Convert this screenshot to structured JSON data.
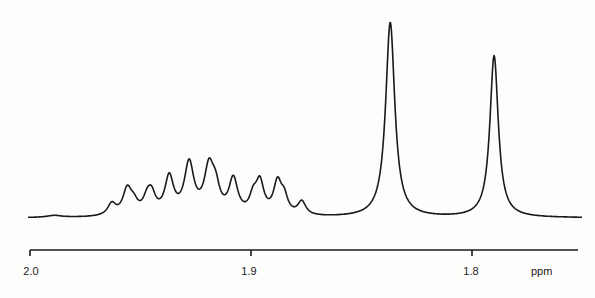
{
  "chart_data": {
    "type": "line",
    "title": "",
    "xlabel": "ppm",
    "ylabel": "",
    "x_axis_reversed": true,
    "xlim": [
      2.0,
      1.749
    ],
    "grid": false,
    "legend": null,
    "ticks": [
      {
        "value": 2.0,
        "label": "2.0"
      },
      {
        "value": 1.9,
        "label": "1.9"
      },
      {
        "value": 1.8,
        "label": "1.8"
      }
    ],
    "unit_label": "ppm",
    "baseline": 0,
    "peaks": [
      {
        "ppm": 1.989,
        "height": 0.01,
        "width": 0.004
      },
      {
        "ppm": 1.963,
        "height": 0.06,
        "width": 0.0022
      },
      {
        "ppm": 1.956,
        "height": 0.13,
        "width": 0.0024
      },
      {
        "ppm": 1.953,
        "height": 0.05,
        "width": 0.0022
      },
      {
        "ppm": 1.947,
        "height": 0.07,
        "width": 0.0022
      },
      {
        "ppm": 1.945,
        "height": 0.09,
        "width": 0.0022
      },
      {
        "ppm": 1.937,
        "height": 0.19,
        "width": 0.0024
      },
      {
        "ppm": 1.928,
        "height": 0.26,
        "width": 0.0026
      },
      {
        "ppm": 1.919,
        "height": 0.23,
        "width": 0.0026
      },
      {
        "ppm": 1.916,
        "height": 0.11,
        "width": 0.0022
      },
      {
        "ppm": 1.908,
        "height": 0.18,
        "width": 0.0024
      },
      {
        "ppm": 1.899,
        "height": 0.08,
        "width": 0.002
      },
      {
        "ppm": 1.896,
        "height": 0.16,
        "width": 0.0022
      },
      {
        "ppm": 1.888,
        "height": 0.16,
        "width": 0.0022
      },
      {
        "ppm": 1.885,
        "height": 0.08,
        "width": 0.002
      },
      {
        "ppm": 1.877,
        "height": 0.07,
        "width": 0.0022
      },
      {
        "ppm": 1.837,
        "height": 1.0,
        "width": 0.0025
      },
      {
        "ppm": 1.79,
        "height": 0.83,
        "width": 0.0023
      }
    ]
  },
  "axis": {
    "tick_labels": [
      "2.0",
      "1.9",
      "1.8"
    ],
    "unit": "ppm"
  }
}
